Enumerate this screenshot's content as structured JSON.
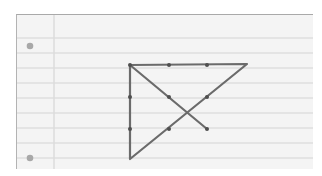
{
  "scene": {
    "description": "Lined notebook paper with the nine-dot puzzle solved using four connected straight lines",
    "paper_color": "#f4f4f4",
    "rule_color": "#d2d2d2",
    "margin_color": "#dedede",
    "ink_color": "#6b6b6b",
    "punch_hole_color": "#a8a8a8"
  },
  "puzzle": {
    "name": "nine-dot puzzle",
    "grid_dots": [
      {
        "x": 129,
        "y": 64
      },
      {
        "x": 168,
        "y": 64
      },
      {
        "x": 206,
        "y": 64
      },
      {
        "x": 129,
        "y": 96
      },
      {
        "x": 168,
        "y": 96
      },
      {
        "x": 206,
        "y": 96
      },
      {
        "x": 129,
        "y": 128
      },
      {
        "x": 168,
        "y": 128
      },
      {
        "x": 206,
        "y": 128
      }
    ],
    "segments": [
      {
        "from": [
          129,
          64
        ],
        "to": [
          246,
          63
        ]
      },
      {
        "from": [
          246,
          63
        ],
        "to": [
          129,
          158
        ]
      },
      {
        "from": [
          129,
          158
        ],
        "to": [
          129,
          64
        ]
      },
      {
        "from": [
          129,
          64
        ],
        "to": [
          206,
          128
        ]
      }
    ]
  }
}
